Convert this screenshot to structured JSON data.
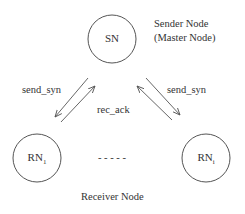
{
  "diagram": {
    "nodes": {
      "sender": {
        "label": "SN",
        "subscript": ""
      },
      "receiver_1": {
        "label": "RN",
        "subscript": "1"
      },
      "receiver_i": {
        "label": "RN",
        "subscript": "i"
      }
    },
    "annotations": {
      "sender_line1": "Sender Node",
      "sender_line2": "(Master Node)",
      "receiver": "Receiver Node",
      "ellipsis": "- - - - -"
    },
    "edges": {
      "left_send": "send_syn",
      "right_send": "send_syn",
      "ack": "rec_ack"
    },
    "colors": {
      "stroke": "#555555",
      "text": "#333333",
      "background": "#ffffff"
    }
  }
}
